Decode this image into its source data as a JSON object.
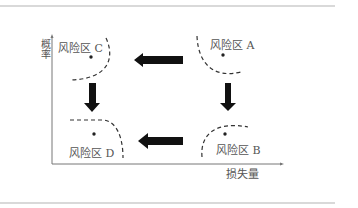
{
  "diagram": {
    "y_axis": {
      "label": "概率"
    },
    "x_axis": {
      "label": "损失量"
    },
    "regions": {
      "A": {
        "label": "风险区 A",
        "position": "top-right"
      },
      "B": {
        "label": "风险区 B",
        "position": "bottom-right"
      },
      "C": {
        "label": "风险区 C",
        "position": "top-left"
      },
      "D": {
        "label": "风险区 D",
        "position": "bottom-left"
      }
    },
    "arrows": [
      {
        "from": "A",
        "to": "C",
        "direction": "left"
      },
      {
        "from": "A",
        "to": "B",
        "direction": "down"
      },
      {
        "from": "C",
        "to": "D",
        "direction": "down"
      },
      {
        "from": "B",
        "to": "D",
        "direction": "left"
      }
    ]
  },
  "colors": {
    "text": "#555555",
    "axis": "#777777",
    "boundary": "#333333",
    "arrow": "#111111",
    "rule": "#cccccc",
    "background": "#ffffff"
  }
}
